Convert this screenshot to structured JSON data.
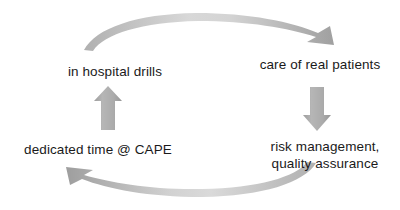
{
  "diagram": {
    "type": "cycle",
    "direction": "clockwise",
    "background_color": "#ffffff",
    "text_color": "#1a1a1a",
    "arrow_color": "#a8a8a8",
    "arrow_color_light": "#c9c9c9",
    "nodes": [
      {
        "id": "drills",
        "label": "in hospital drills",
        "position": "top-left"
      },
      {
        "id": "care",
        "label": "care of real patients",
        "position": "top-right"
      },
      {
        "id": "cape",
        "label": "dedicated time @ CAPE",
        "position": "bottom-left"
      },
      {
        "id": "risk",
        "label": "risk management,\nquality assurance",
        "position": "bottom-right"
      }
    ],
    "arrows": [
      {
        "id": "top-arc",
        "from": "drills",
        "to": "care",
        "shape": "curved-arc",
        "points": "right"
      },
      {
        "id": "right-down",
        "from": "care",
        "to": "risk",
        "shape": "block-arrow",
        "points": "down"
      },
      {
        "id": "bottom-arc",
        "from": "risk",
        "to": "cape",
        "shape": "curved-arc",
        "points": "left"
      },
      {
        "id": "left-up",
        "from": "cape",
        "to": "drills",
        "shape": "block-arrow",
        "points": "up"
      }
    ]
  }
}
